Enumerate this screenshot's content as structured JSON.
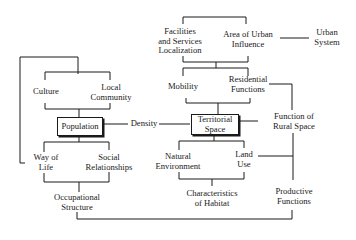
{
  "diagram": {
    "nodes": {
      "facilities": "Facilities and Services Localization",
      "facilities_l1": "Facilities",
      "facilities_l2": "and Services",
      "facilities_l3": "Localization",
      "urban_influence_l1": "Area of Urban",
      "urban_influence_l2": "Influence",
      "urban_system_l1": "Urban",
      "urban_system_l2": "System",
      "culture": "Culture",
      "local_community_l1": "Local",
      "local_community_l2": "Community",
      "mobility": "Mobility",
      "residential_l1": "Residential",
      "residential_l2": "Functions",
      "population": "Population",
      "density": "Density",
      "territorial_l1": "Territorial",
      "territorial_l2": "Space",
      "rural_function_l1": "Function of",
      "rural_function_l2": "Rural Space",
      "way_of_life_l1": "Way of",
      "way_of_life_l2": "Life",
      "social_rel_l1": "Social",
      "social_rel_l2": "Relationships",
      "natural_env_l1": "Natural",
      "natural_env_l2": "Environment",
      "land_use_l1": "Land",
      "land_use_l2": "Use",
      "occupational_l1": "Occupational",
      "occupational_l2": "Structure",
      "habitat_l1": "Characteristics",
      "habitat_l2": "of Habitat",
      "productive_l1": "Productive",
      "productive_l2": "Functions"
    },
    "highlighted_nodes": [
      "Population",
      "Territorial Space"
    ],
    "line_color": "#1a1a1a"
  }
}
